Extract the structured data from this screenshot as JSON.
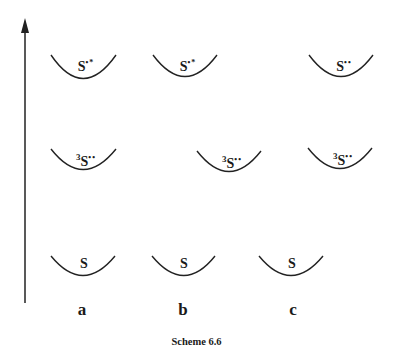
{
  "diagram": {
    "caption": "Scheme 6.6",
    "axis": {
      "direction": "up",
      "label": ""
    },
    "columns": [
      {
        "id": "a",
        "label": "a"
      },
      {
        "id": "b",
        "label": "b"
      },
      {
        "id": "c",
        "label": "c"
      }
    ],
    "states": {
      "excited_singlet": {
        "prefix": "",
        "symbol": "S",
        "suffix": "•*"
      },
      "triplet_biradical": {
        "prefix": "3",
        "symbol": "S",
        "suffix": "••"
      },
      "ground": {
        "prefix": "",
        "symbol": "S",
        "suffix": ""
      }
    },
    "wells": [
      {
        "column": "a",
        "state": "excited_singlet",
        "cx": 83,
        "top": 54,
        "width": 65,
        "depth": 24
      },
      {
        "column": "b",
        "state": "excited_singlet",
        "cx": 185,
        "top": 54,
        "width": 64,
        "depth": 22
      },
      {
        "column": "c",
        "state": "excited_singlet",
        "cx": 341,
        "top": 54,
        "width": 64,
        "depth": 22
      },
      {
        "column": "a",
        "state": "triplet_biradical",
        "cx": 83,
        "top": 148,
        "width": 65,
        "depth": 21
      },
      {
        "column": "b",
        "state": "triplet_biradical",
        "cx": 229,
        "top": 150,
        "width": 64,
        "depth": 21
      },
      {
        "column": "c",
        "state": "triplet_biradical",
        "cx": 340,
        "top": 147,
        "width": 64,
        "depth": 21
      },
      {
        "column": "a",
        "state": "ground",
        "cx": 83,
        "top": 255,
        "width": 64,
        "depth": 20
      },
      {
        "column": "b",
        "state": "ground",
        "cx": 184,
        "top": 255,
        "width": 63,
        "depth": 20
      },
      {
        "column": "c",
        "state": "ground",
        "cx": 291,
        "top": 255,
        "width": 64,
        "depth": 20
      }
    ],
    "labels": {
      "a_top_pre": "",
      "a_top_sym": "S",
      "a_top_post": "•*",
      "b_top_pre": "",
      "b_top_sym": "S",
      "b_top_post": "•*",
      "c_top_pre": "",
      "c_top_sym": "S",
      "c_top_post": "••",
      "a_mid_pre": "3",
      "a_mid_sym": "S",
      "a_mid_post": "••",
      "b_mid_pre": "3",
      "b_mid_sym": "S",
      "b_mid_post": "••",
      "c_mid_pre": "3",
      "c_mid_sym": "S",
      "c_mid_post": "••",
      "a_bot_sym": "S",
      "b_bot_sym": "S",
      "c_bot_sym": "S"
    },
    "col_labels": {
      "a": "a",
      "b": "b",
      "c": "c"
    }
  }
}
